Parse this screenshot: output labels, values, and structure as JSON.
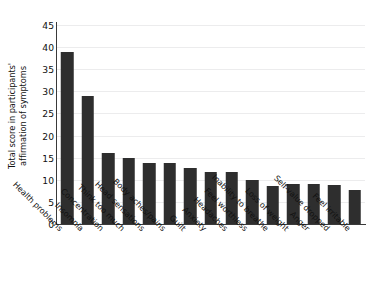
{
  "chart_data": {
    "type": "bar",
    "title": "",
    "xlabel": "",
    "ylabel": "Total score in participants' affirmation of symptoms",
    "ylabel_line1": "Total score in participants'",
    "ylabel_line2": "affirmation of symptoms",
    "ylim": [
      0,
      45
    ],
    "ytick_values": [
      0,
      5,
      10,
      15,
      20,
      25,
      30,
      35,
      40,
      45
    ],
    "ytick_labels": [
      "0",
      "5",
      "10",
      "15",
      "20",
      "25",
      "30",
      "35",
      "40",
      "45"
    ],
    "grid": true,
    "legend": "none",
    "bar_color": "#2e2e2e",
    "categories": [
      "Health problems",
      "Insomnia",
      "Concentration",
      "Think too much",
      "Head sensations",
      "Body aches/pains",
      "Guilt",
      "Anxiety",
      "Headaches",
      "Feel worthless",
      "Inability to breathe",
      "Loss of weight",
      "Anger",
      "Self-value dropped",
      "Feel irritable"
    ],
    "values": [
      39,
      29,
      16,
      15,
      13.8,
      13.7,
      12.7,
      11.7,
      11.7,
      9.9,
      8.7,
      9,
      9,
      8.8,
      7.7
    ]
  }
}
